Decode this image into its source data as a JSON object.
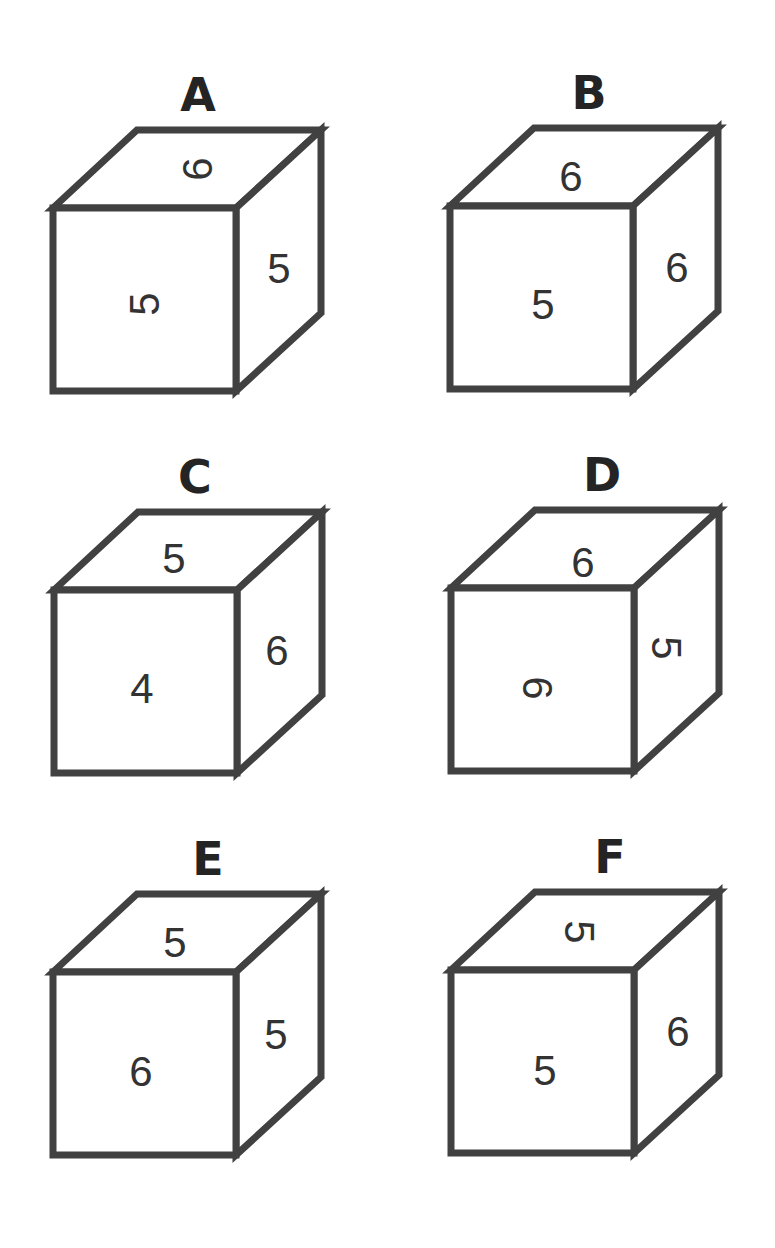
{
  "puzzle": {
    "stroke_color": "#414141",
    "label_color": "#242424",
    "digit_color": "#333333",
    "background": "#ffffff",
    "cubes": [
      {
        "label": "A",
        "top": {
          "value": "6",
          "rotation": -90
        },
        "front": {
          "value": "5",
          "rotation": -90
        },
        "right": {
          "value": "5",
          "rotation": 0
        }
      },
      {
        "label": "B",
        "top": {
          "value": "6",
          "rotation": 0
        },
        "front": {
          "value": "5",
          "rotation": 0
        },
        "right": {
          "value": "6",
          "rotation": 0
        }
      },
      {
        "label": "C",
        "top": {
          "value": "5",
          "rotation": 0
        },
        "front": {
          "value": "4",
          "rotation": 0
        },
        "right": {
          "value": "6",
          "rotation": 0
        }
      },
      {
        "label": "D",
        "top": {
          "value": "6",
          "rotation": 0
        },
        "front": {
          "value": "6",
          "rotation": 90
        },
        "right": {
          "value": "5",
          "rotation": 90
        }
      },
      {
        "label": "E",
        "top": {
          "value": "5",
          "rotation": 0
        },
        "front": {
          "value": "6",
          "rotation": 0
        },
        "right": {
          "value": "5",
          "rotation": 0
        }
      },
      {
        "label": "F",
        "top": {
          "value": "5",
          "rotation": 90
        },
        "front": {
          "value": "5",
          "rotation": 0
        },
        "right": {
          "value": "6",
          "rotation": 0
        }
      }
    ]
  }
}
